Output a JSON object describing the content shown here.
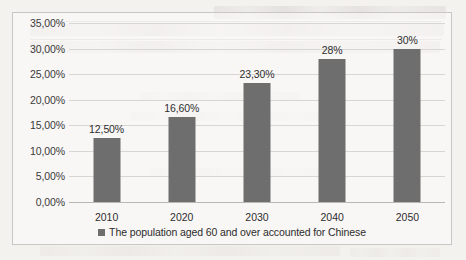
{
  "chart_data": {
    "type": "bar",
    "title": "",
    "xlabel": "",
    "ylabel": "",
    "categories": [
      "2010",
      "2020",
      "2030",
      "2040",
      "2050"
    ],
    "values": [
      12.5,
      16.6,
      23.3,
      28,
      30
    ],
    "data_labels": [
      "12,50%",
      "16,60%",
      "23,30%",
      "28%",
      "30%"
    ],
    "series": [
      {
        "name": "The population aged 60 and over accounted for Chinese",
        "values": [
          12.5,
          16.6,
          23.3,
          28,
          30
        ],
        "color": "#6e6e6e"
      }
    ],
    "ylim": [
      0,
      35
    ],
    "ytick_values": [
      0,
      5,
      10,
      15,
      20,
      25,
      30,
      35
    ],
    "ytick_labels": [
      "0,00%",
      "5,00%",
      "10,00%",
      "15,00%",
      "20,00%",
      "25,00%",
      "30,00%",
      "35,00%"
    ],
    "grid": true,
    "legend_position": "bottom"
  },
  "legend": {
    "marker": "square-marker",
    "label": "The population aged 60 and over accounted for Chinese"
  },
  "colors": {
    "bar": "#6e6e6e",
    "gridline": "#d8d6d3",
    "axis": "#b9b7b4",
    "border": "#c9c7c4",
    "page_background": "#f4f2ef",
    "text": "#2e2e2e"
  }
}
